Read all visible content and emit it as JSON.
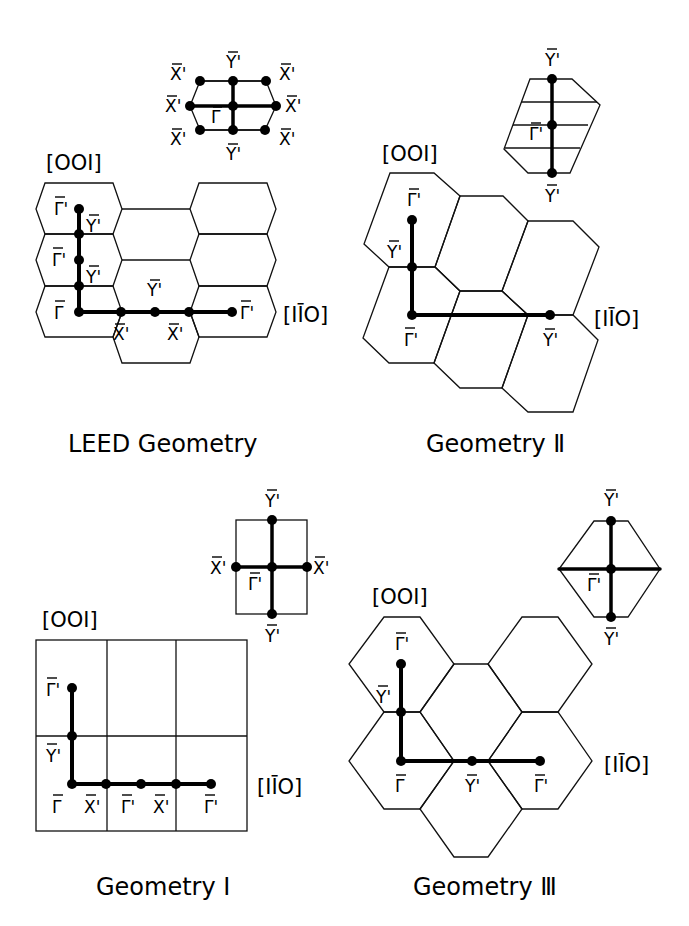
{
  "figure": {
    "panels": [
      {
        "id": "leed",
        "caption": "LEED Geometry",
        "axis_vertical": "[001]",
        "axis_horizontal": "[1̅0]",
        "inset_labels": {
          "top": "Y'",
          "bottom": "Y'",
          "center": "Γ",
          "top_left": "X'",
          "mid_left": "X'",
          "bottom_left": "X'",
          "top_right": "X'",
          "mid_right": "X'",
          "bottom_right": "X'"
        },
        "path_labels": [
          "Γ'",
          "Y'",
          "Γ'",
          "Y'",
          "Γ",
          "X'",
          "Y'",
          "X'",
          "Γ'"
        ]
      },
      {
        "id": "geom2",
        "caption": "Geometry Ⅱ",
        "axis_vertical": "[001]",
        "axis_horizontal": "[1̅0]",
        "inset_labels": {
          "top": "Y'",
          "center": "Γ'",
          "bottom": "Y'"
        },
        "path_labels": [
          "Γ'",
          "Y'",
          "Γ'",
          "Y'"
        ]
      },
      {
        "id": "geom1",
        "caption": "Geometry Ⅰ",
        "axis_vertical": "[001]",
        "axis_horizontal": "[1̅0]",
        "inset_labels": {
          "top": "Y'",
          "left": "X'",
          "right": "X'",
          "center": "Γ'",
          "bottom": "Y'"
        },
        "path_labels": [
          "Γ'",
          "Y'",
          "Γ",
          "X'",
          "Γ'",
          "X'",
          "Γ'"
        ]
      },
      {
        "id": "geom3",
        "caption": "Geometry Ⅲ",
        "axis_vertical": "[001]",
        "axis_horizontal": "[1̅0]",
        "inset_labels": {
          "top": "Y'",
          "center": "Γ'",
          "bottom": "Y'"
        },
        "path_labels": [
          "Γ'",
          "Y'",
          "Γ",
          "Y'",
          "Γ'"
        ]
      }
    ],
    "labels": {
      "dir001": "[OOI]",
      "dir110": "[IĪO]"
    }
  }
}
